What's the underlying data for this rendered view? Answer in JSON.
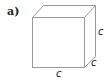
{
  "figure": {
    "part_label": "a)",
    "shape": "cube",
    "edge_labels": {
      "right": "c",
      "depth": "c",
      "bottom": "c"
    },
    "stroke_color": "#9a9a9a"
  }
}
